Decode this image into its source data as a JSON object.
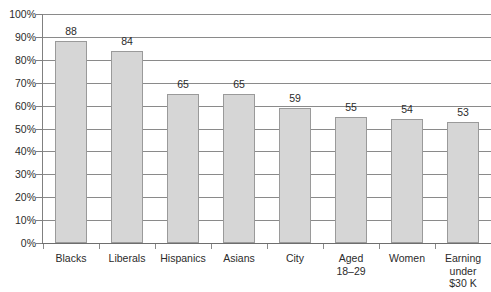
{
  "chart_data": {
    "type": "bar",
    "title": "",
    "subtitle": "",
    "xlabel": "",
    "ylabel": "",
    "ylim": [
      0,
      100
    ],
    "y_tick_labels": [
      "100%",
      "90%",
      "80%",
      "70%",
      "60%",
      "50%",
      "40%",
      "30%",
      "20%",
      "10%",
      "0%"
    ],
    "y_tick_values": [
      100,
      90,
      80,
      70,
      60,
      50,
      40,
      30,
      20,
      10,
      0
    ],
    "grid": true,
    "legend": null,
    "legend_position": "none",
    "categories": [
      "Blacks",
      "Liberals",
      "Hispanics",
      "Asians",
      "City",
      "Aged\n18–29",
      "Women",
      "Earning\nunder\n$30 K"
    ],
    "values": [
      88,
      84,
      65,
      65,
      59,
      55,
      54,
      53
    ],
    "value_labels": [
      "88",
      "84",
      "65",
      "65",
      "59",
      "55",
      "54",
      "53"
    ],
    "colors": {
      "bar_fill": "#d6d6d6",
      "bar_border": "#9a9a9a",
      "gridline": "#8a8a8a",
      "axis": "#6e6e6e",
      "text": "#2b2b2b",
      "background": "#ffffff"
    }
  }
}
